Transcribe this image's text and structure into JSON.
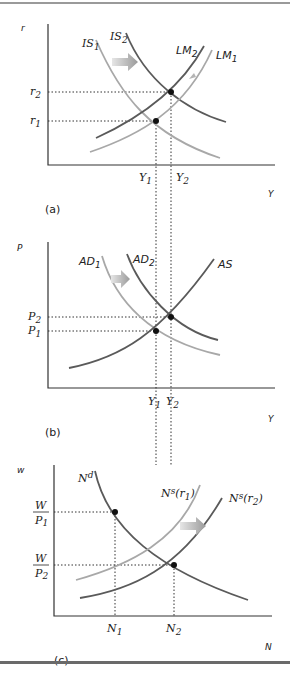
{
  "colors": {
    "dark_curve": "#5a5a5a",
    "light_curve": "#a8a8a8",
    "arrow": "#b0b0b0",
    "point": "#111111"
  },
  "panels": [
    {
      "id": "a",
      "tag": "(a)",
      "y_axis": "r",
      "x_axis": "Y",
      "y_ticks": [
        "r2",
        "r1"
      ],
      "x_ticks": [
        "Y1",
        "Y2"
      ],
      "curves": [
        {
          "name": "IS1",
          "label": "IS",
          "sub": "1",
          "shade": "light"
        },
        {
          "name": "IS2",
          "label": "IS",
          "sub": "2",
          "shade": "dark"
        },
        {
          "name": "LM2",
          "label": "LM",
          "sub": "2",
          "shade": "dark"
        },
        {
          "name": "LM1",
          "label": "LM",
          "sub": "1",
          "shade": "light"
        }
      ],
      "shifts": [
        "IS shifts right",
        "LM shifts left"
      ]
    },
    {
      "id": "b",
      "tag": "(b)",
      "y_axis": "P",
      "x_axis": "Y",
      "y_ticks": [
        "P2",
        "P1"
      ],
      "x_ticks": [
        "Y1",
        "Y2"
      ],
      "curves": [
        {
          "name": "AD1",
          "label": "AD",
          "sub": "1",
          "shade": "light"
        },
        {
          "name": "AD2",
          "label": "AD",
          "sub": "2",
          "shade": "dark"
        },
        {
          "name": "AS",
          "label": "AS",
          "sub": "",
          "shade": "dark"
        }
      ],
      "shifts": [
        "AD shifts right"
      ]
    },
    {
      "id": "c",
      "tag": "(c)",
      "y_axis": "w",
      "x_axis": "N",
      "y_ticks": [
        {
          "num": "W",
          "den": "P",
          "sub": "1"
        },
        {
          "num": "W",
          "den": "P",
          "sub": "2"
        }
      ],
      "x_ticks": [
        "N1",
        "N2"
      ],
      "curves": [
        {
          "name": "Nd",
          "label": "N",
          "sup": "d",
          "shade": "dark"
        },
        {
          "name": "Ns(r1)",
          "label": "N",
          "sup": "s",
          "arg": "(r",
          "argsub": "1",
          "shade": "light"
        },
        {
          "name": "Ns(r2)",
          "label": "N",
          "sup": "s",
          "arg": "(r",
          "argsub": "2",
          "shade": "dark"
        }
      ],
      "shifts": [
        "Labor supply shifts right"
      ]
    }
  ],
  "text": {
    "a_r": "r",
    "a_Y": "Y",
    "a_tag": "(a)",
    "a_r2": "r",
    "a_r2s": "2",
    "a_r1": "r",
    "a_r1s": "1",
    "a_Y1": "Y",
    "a_Y1s": "1",
    "a_Y2": "Y",
    "a_Y2s": "2",
    "IS": "IS",
    "LM": "LM",
    "s1": "1",
    "s2": "2",
    "b_P": "P",
    "b_Y": "Y",
    "b_tag": "(b)",
    "b_P2": "P",
    "b_P1": "P",
    "AD": "AD",
    "AS": "AS",
    "c_w": "w",
    "c_N": "N",
    "c_tag": "(c)",
    "W": "W",
    "Pden": "P",
    "N": "N",
    "Nd_sup": "d",
    "Ns_sup": "s",
    "r_arg": "(r",
    "close": ")"
  }
}
